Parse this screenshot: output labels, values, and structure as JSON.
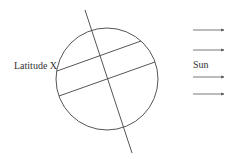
{
  "diagram": {
    "labels": {
      "latitude": "Latitude X",
      "sun": "Sun"
    },
    "colors": {
      "stroke": "#555555",
      "text": "#333333",
      "background": "#ffffff"
    },
    "earth": {
      "cx": 107,
      "cy": 79,
      "r": 51
    },
    "axis": {
      "x1": 85,
      "y1": 10,
      "x2": 132,
      "y2": 153
    },
    "latitude_lines": [
      {
        "x1": 57,
        "y1": 71,
        "x2": 141,
        "y2": 41
      },
      {
        "x1": 59,
        "y1": 96,
        "x2": 155,
        "y2": 62
      }
    ],
    "sun_rays_y": [
      30,
      50,
      77,
      94
    ]
  }
}
